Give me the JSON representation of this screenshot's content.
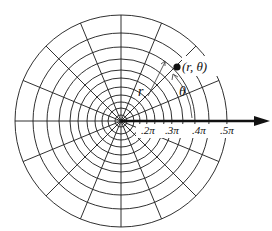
{
  "diagram": {
    "center": {
      "x": 121,
      "y": 121
    },
    "circle_radii": [
      6,
      13,
      19,
      26,
      34,
      43,
      51,
      62,
      74,
      88,
      106
    ],
    "ray_count": 16,
    "colors": {
      "line": "#1a1a1a",
      "axis": "#111111",
      "background": "#ffffff"
    },
    "polar_axis": {
      "label": "polar axis",
      "tick_labels": [
        ".2π",
        ".3π",
        ".4π",
        ".5π"
      ]
    },
    "point": {
      "label": "(r, θ)",
      "angle_deg": 45,
      "radius": 77
    },
    "annotations": {
      "r_label": "r",
      "theta_label": "θ"
    }
  }
}
